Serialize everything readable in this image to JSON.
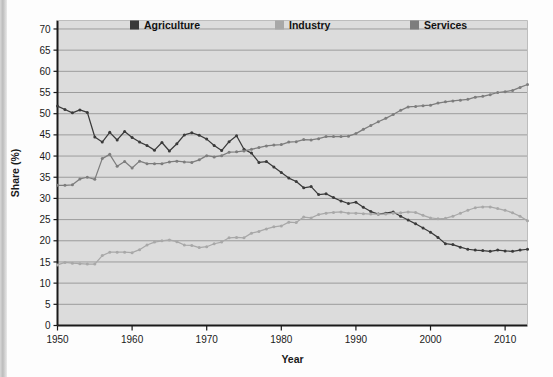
{
  "chart_data": {
    "type": "line",
    "title": "",
    "xlabel": "Year",
    "ylabel": "Share (%)",
    "xlim": [
      1950,
      2013
    ],
    "ylim": [
      0,
      72
    ],
    "yticks": [
      0,
      5,
      10,
      15,
      20,
      25,
      30,
      35,
      40,
      45,
      50,
      55,
      60,
      65,
      70
    ],
    "xticks": [
      1950,
      1960,
      1970,
      1980,
      1990,
      2000,
      2010
    ],
    "grid": "horizontal",
    "legend_position": "top-inside",
    "markers": true,
    "colors": {
      "agriculture": "#3a3a3a",
      "industry": "#a8a8a8",
      "services": "#7d7d7d",
      "plot_background": "#dcdcdc",
      "gridline": "#8c8c8c",
      "axis": "#1a1a1a",
      "page_background": "#fdfdfd"
    },
    "x": [
      1950,
      1951,
      1952,
      1953,
      1954,
      1955,
      1956,
      1957,
      1958,
      1959,
      1960,
      1961,
      1962,
      1963,
      1964,
      1965,
      1966,
      1967,
      1968,
      1969,
      1970,
      1971,
      1972,
      1973,
      1974,
      1975,
      1976,
      1977,
      1978,
      1979,
      1980,
      1981,
      1982,
      1983,
      1984,
      1985,
      1986,
      1987,
      1988,
      1989,
      1990,
      1991,
      1992,
      1993,
      1994,
      1995,
      1996,
      1997,
      1998,
      1999,
      2000,
      2001,
      2002,
      2003,
      2004,
      2005,
      2006,
      2007,
      2008,
      2009,
      2010,
      2011,
      2012,
      2013
    ],
    "series": [
      {
        "name": "Agriculture",
        "color": "#3a3a3a",
        "values": [
          51.8,
          51.0,
          50.2,
          50.9,
          50.3,
          44.5,
          43.3,
          45.6,
          43.8,
          45.8,
          44.4,
          43.3,
          42.5,
          41.4,
          43.2,
          41.2,
          42.9,
          45.0,
          45.5,
          44.9,
          44.0,
          42.5,
          41.3,
          43.4,
          44.8,
          41.6,
          40.7,
          38.5,
          38.7,
          37.4,
          36.1,
          34.8,
          34.0,
          32.5,
          32.8,
          30.9,
          31.1,
          30.2,
          29.4,
          28.8,
          29.1,
          27.9,
          26.9,
          26.3,
          26.5,
          26.8,
          25.8,
          24.9,
          24.0,
          23.0,
          22.0,
          20.8,
          19.3,
          19.1,
          18.5,
          18.0,
          17.8,
          17.7,
          17.5,
          17.8,
          17.6,
          17.5,
          17.8,
          18.0
        ]
      },
      {
        "name": "Industry",
        "color": "#a8a8a8",
        "values": [
          14.3,
          14.9,
          14.7,
          14.6,
          14.5,
          14.5,
          16.5,
          17.3,
          17.3,
          17.3,
          17.2,
          17.9,
          19.0,
          19.7,
          20.0,
          20.2,
          19.8,
          19.0,
          18.9,
          18.4,
          18.6,
          19.3,
          19.7,
          20.7,
          20.8,
          20.7,
          21.8,
          22.2,
          22.8,
          23.3,
          23.5,
          24.4,
          24.3,
          25.6,
          25.4,
          26.2,
          26.5,
          26.7,
          26.8,
          26.5,
          26.5,
          26.4,
          26.3,
          26.3,
          26.3,
          26.5,
          26.6,
          26.8,
          26.7,
          26.0,
          25.4,
          25.2,
          25.3,
          25.8,
          26.5,
          27.2,
          27.8,
          28.0,
          28.0,
          27.6,
          27.2,
          26.6,
          25.8,
          24.7
        ]
      },
      {
        "name": "Services",
        "color": "#7d7d7d",
        "values": [
          33.1,
          33.1,
          33.2,
          34.6,
          35.0,
          34.5,
          39.4,
          40.4,
          37.6,
          38.7,
          37.2,
          38.8,
          38.2,
          38.2,
          38.2,
          38.6,
          38.8,
          38.6,
          38.5,
          39.1,
          40.1,
          39.8,
          40.1,
          40.9,
          41.0,
          41.2,
          41.6,
          42.0,
          42.4,
          42.6,
          42.7,
          43.3,
          43.4,
          43.9,
          43.8,
          44.1,
          44.6,
          44.6,
          44.6,
          44.7,
          45.3,
          46.3,
          47.2,
          48.1,
          48.9,
          49.8,
          50.8,
          51.6,
          51.7,
          51.9,
          52.0,
          52.5,
          52.8,
          53.0,
          53.2,
          53.4,
          53.9,
          54.1,
          54.5,
          55.0,
          55.2,
          55.5,
          56.2,
          56.9
        ]
      }
    ]
  },
  "legend": {
    "items": [
      {
        "label": "Agriculture",
        "color": "#3a3a3a"
      },
      {
        "label": "Industry",
        "color": "#a8a8a8"
      },
      {
        "label": "Services",
        "color": "#7d7d7d"
      }
    ]
  },
  "axes": {
    "y_title": "Share (%)",
    "x_title": "Year",
    "y_tick_labels": [
      "70",
      "65",
      "60",
      "55",
      "50",
      "45",
      "40",
      "35",
      "30",
      "25",
      "20",
      "15",
      "10",
      "5",
      "0"
    ],
    "x_tick_labels": [
      "1950",
      "1960",
      "1970",
      "1980",
      "1990",
      "2000",
      "2010"
    ]
  }
}
